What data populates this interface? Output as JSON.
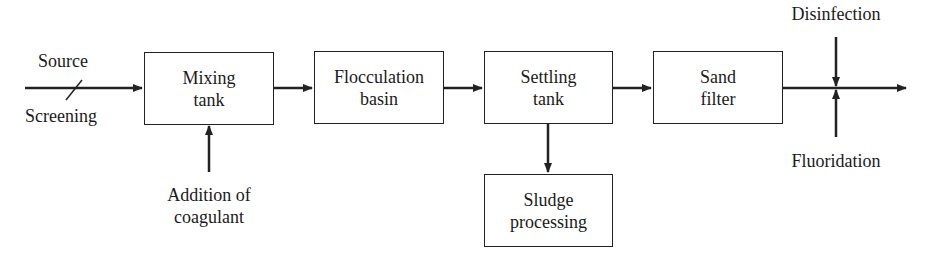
{
  "diagram": {
    "type": "process-flow",
    "boxes": [
      {
        "id": "mixing",
        "line1": "Mixing",
        "line2": "tank"
      },
      {
        "id": "flocculation",
        "line1": "Flocculation",
        "line2": "basin"
      },
      {
        "id": "settling",
        "line1": "Settling",
        "line2": "tank"
      },
      {
        "id": "sand",
        "line1": "Sand",
        "line2": "filter"
      },
      {
        "id": "sludge",
        "line1": "Sludge",
        "line2": "processing"
      }
    ],
    "labels": {
      "source": "Source",
      "screening": "Screening",
      "addition_line1": "Addition of",
      "addition_line2": "coagulant",
      "disinfection": "Disinfection",
      "fluoridation": "Fluoridation"
    },
    "colors": {
      "stroke": "#222222",
      "background": "#ffffff"
    }
  }
}
